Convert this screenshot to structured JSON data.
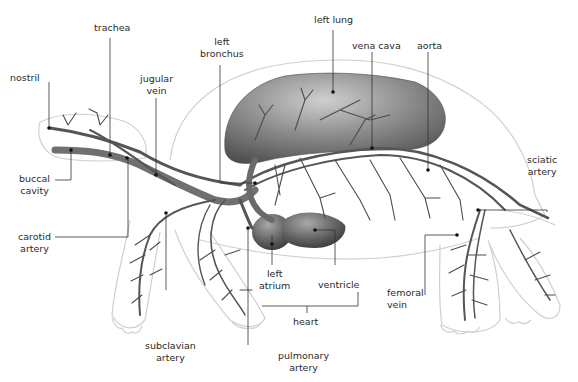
{
  "diagram": {
    "labels": {
      "nostril": "nostril",
      "trachea": "trachea",
      "jugular_vein": [
        "jugular",
        "vein"
      ],
      "left_bronchus": [
        "left",
        "bronchus"
      ],
      "left_lung": "left lung",
      "vena_cava": "vena cava",
      "aorta": "aorta",
      "sciatic_artery": [
        "sciatic",
        "artery"
      ],
      "buccal_cavity": [
        "buccal",
        "cavity"
      ],
      "carotid_artery": [
        "carotid",
        "artery"
      ],
      "left_atrium": [
        "left",
        "atrium"
      ],
      "ventricle": "ventricle",
      "heart": "heart",
      "femoral_vein": [
        "femoral",
        "vein"
      ],
      "subclavian_artery": [
        "subclavian",
        "artery"
      ],
      "pulmonary_artery": [
        "pulmonary",
        "artery"
      ]
    },
    "colors": {
      "outline": "#c8c8c8",
      "vessel": "#555555",
      "organ": "#6e6e6e",
      "leader": "#333333",
      "text": "#2a2a2a"
    }
  }
}
